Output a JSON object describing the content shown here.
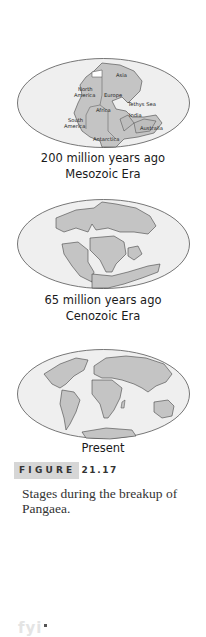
{
  "figure": {
    "label_word": "FIGURE",
    "label_number": "21.17",
    "caption": "Stages during the breakup of Pangaea."
  },
  "stages": [
    {
      "line1": "200 million years ago",
      "line2": "Mesozoic Era",
      "map_labels": {
        "asia": "Asia",
        "north": "North",
        "america_n": "America",
        "europe": "Europe",
        "tethys": "Tethys Sea",
        "africa": "Africa",
        "india": "India",
        "south": "South",
        "america_s": "America",
        "australia": "Australia",
        "antarctica": "Antarctica"
      }
    },
    {
      "line1": "65 million years ago",
      "line2": "Cenozoic Era"
    },
    {
      "line1": "Present"
    }
  ],
  "footer": {
    "logo_text": "fyi"
  },
  "colors": {
    "ocean": "#efefef",
    "land": "#c4c4c4",
    "outline": "#555555",
    "label_box": "#d6d6d6"
  }
}
